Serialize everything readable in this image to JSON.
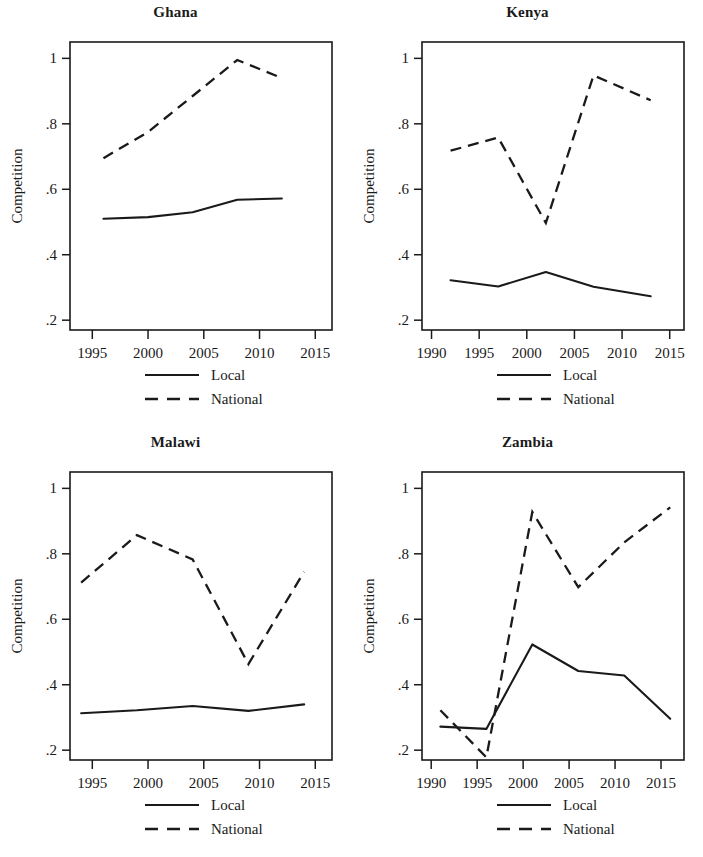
{
  "figure": {
    "width": 703,
    "height": 857,
    "background": "#ffffff",
    "ink_color": "#1a1a1a",
    "y_axis_title": "Competition",
    "legend": {
      "local_label": "Local",
      "national_label": "National"
    }
  },
  "chart_data": [
    {
      "type": "line",
      "title": "Ghana",
      "xlabel": "",
      "ylabel": "Competition",
      "xlim": [
        1993,
        2016.5
      ],
      "ylim": [
        0.17,
        1.05
      ],
      "xticks": [
        1995,
        2000,
        2005,
        2010,
        2015
      ],
      "xtick_labels": [
        "1995",
        "2000",
        "2005",
        "2010",
        "2015"
      ],
      "yticks": [
        0.2,
        0.4,
        0.6,
        0.8,
        1.0
      ],
      "ytick_labels": [
        ".2",
        ".4",
        ".6",
        ".8",
        "1"
      ],
      "grid": false,
      "legend_position": "below",
      "series": [
        {
          "name": "Local",
          "style": "solid",
          "x": [
            1996,
            2000,
            2004,
            2008,
            2012
          ],
          "values": [
            0.51,
            0.515,
            0.53,
            0.568,
            0.572
          ]
        },
        {
          "name": "National",
          "style": "dashed",
          "x": [
            1996,
            2000,
            2004,
            2008,
            2012
          ],
          "values": [
            0.695,
            0.775,
            0.885,
            0.995,
            0.94
          ]
        }
      ]
    },
    {
      "type": "line",
      "title": "Kenya",
      "xlabel": "",
      "ylabel": "Competition",
      "xlim": [
        1989,
        2016.5
      ],
      "ylim": [
        0.17,
        1.05
      ],
      "xticks": [
        1990,
        1995,
        2000,
        2005,
        2010,
        2015
      ],
      "xtick_labels": [
        "1990",
        "1995",
        "2000",
        "2005",
        "2010",
        "2015"
      ],
      "yticks": [
        0.2,
        0.4,
        0.6,
        0.8,
        1.0
      ],
      "ytick_labels": [
        ".2",
        ".4",
        ".6",
        ".8",
        "1"
      ],
      "grid": false,
      "legend_position": "below",
      "series": [
        {
          "name": "Local",
          "style": "solid",
          "x": [
            1992,
            1997,
            2002,
            2007,
            2013
          ],
          "values": [
            0.322,
            0.303,
            0.347,
            0.302,
            0.273
          ]
        },
        {
          "name": "National",
          "style": "dashed",
          "x": [
            1992,
            1997,
            2002,
            2007,
            2013
          ],
          "values": [
            0.718,
            0.758,
            0.497,
            0.948,
            0.872
          ]
        }
      ]
    },
    {
      "type": "line",
      "title": "Malawi",
      "xlabel": "",
      "ylabel": "Competition",
      "xlim": [
        1993,
        2016.5
      ],
      "ylim": [
        0.17,
        1.05
      ],
      "xticks": [
        1995,
        2000,
        2005,
        2010,
        2015
      ],
      "xtick_labels": [
        "1995",
        "2000",
        "2005",
        "2010",
        "2015"
      ],
      "yticks": [
        0.2,
        0.4,
        0.6,
        0.8,
        1.0
      ],
      "ytick_labels": [
        ".2",
        ".4",
        ".6",
        ".8",
        "1"
      ],
      "grid": false,
      "legend_position": "below",
      "series": [
        {
          "name": "Local",
          "style": "solid",
          "x": [
            1994,
            1999,
            2004,
            2009,
            2014
          ],
          "values": [
            0.313,
            0.322,
            0.335,
            0.32,
            0.34
          ]
        },
        {
          "name": "National",
          "style": "dashed",
          "x": [
            1994,
            1999,
            2004,
            2009,
            2014
          ],
          "values": [
            0.712,
            0.857,
            0.783,
            0.463,
            0.745
          ]
        }
      ]
    },
    {
      "type": "line",
      "title": "Zambia",
      "xlabel": "",
      "ylabel": "Competition",
      "xlim": [
        1989,
        2017.5
      ],
      "ylim": [
        0.17,
        1.05
      ],
      "xticks": [
        1990,
        1995,
        2000,
        2005,
        2010,
        2015
      ],
      "xtick_labels": [
        "1990",
        "1995",
        "2000",
        "2005",
        "2010",
        "2015"
      ],
      "yticks": [
        0.2,
        0.4,
        0.6,
        0.8,
        1.0
      ],
      "ytick_labels": [
        ".2",
        ".4",
        ".6",
        ".8",
        "1"
      ],
      "grid": false,
      "legend_position": "below",
      "series": [
        {
          "name": "Local",
          "style": "solid",
          "x": [
            1991,
            1996,
            2001,
            2006,
            2011,
            2016
          ],
          "values": [
            0.272,
            0.265,
            0.523,
            0.442,
            0.428,
            0.296
          ]
        },
        {
          "name": "National",
          "style": "dashed",
          "x": [
            1991,
            1996,
            2001,
            2006,
            2011,
            2016
          ],
          "values": [
            0.322,
            0.178,
            0.928,
            0.698,
            0.835,
            0.942
          ]
        }
      ]
    }
  ]
}
